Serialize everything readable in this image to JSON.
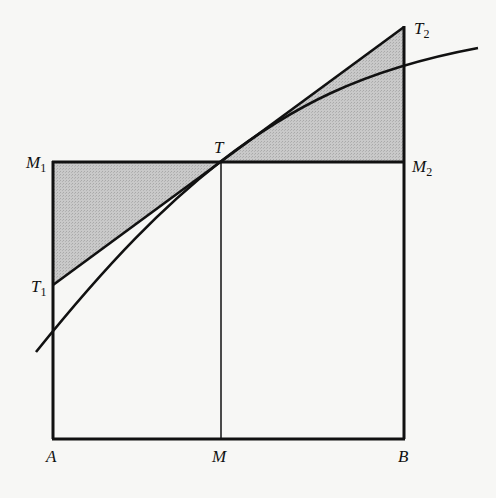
{
  "figure": {
    "type": "geometric-diagram",
    "colors": {
      "background": "#f7f7f5",
      "stroke": "#111111",
      "shade": "#c4c4c4"
    }
  },
  "labels": {
    "A": {
      "main": "A",
      "sub": ""
    },
    "M": {
      "main": "M",
      "sub": ""
    },
    "B": {
      "main": "B",
      "sub": ""
    },
    "M1": {
      "main": "M",
      "sub": "1"
    },
    "M2": {
      "main": "M",
      "sub": "2"
    },
    "T": {
      "main": "T",
      "sub": ""
    },
    "T1": {
      "main": "T",
      "sub": "1"
    },
    "T2": {
      "main": "T",
      "sub": "2"
    }
  },
  "points": {
    "A": [
      53,
      439
    ],
    "M": [
      221,
      439
    ],
    "B": [
      404,
      439
    ],
    "M1": [
      53,
      162
    ],
    "M2": [
      404,
      162
    ],
    "T": [
      220,
      162
    ],
    "T1": [
      53,
      285
    ],
    "T2": [
      404,
      27
    ],
    "curve_start": [
      36,
      352
    ],
    "curve_end": [
      478,
      48
    ]
  }
}
